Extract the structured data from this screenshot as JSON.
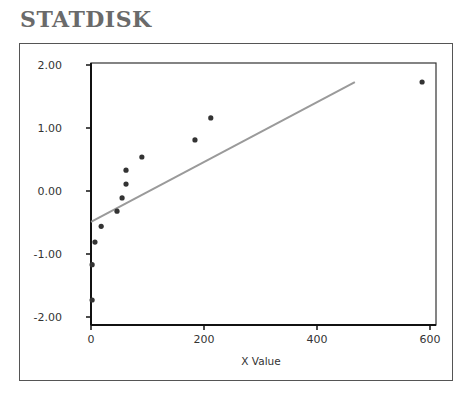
{
  "brand": "STATDISK",
  "chart_data": {
    "type": "scatter",
    "title": "",
    "xlabel": "X Value",
    "ylabel": "",
    "xlim": [
      0,
      610
    ],
    "ylim": [
      -2.1,
      2.1
    ],
    "x_ticks": [
      "0",
      "200",
      "400",
      "600"
    ],
    "y_ticks": [
      "2.00",
      "1.00",
      "0.00",
      "-1.00",
      "-2.00"
    ],
    "grid": false,
    "legend": null,
    "series": [
      {
        "name": "points",
        "type": "scatter",
        "x": [
          2,
          2,
          7,
          18,
          46,
          55,
          62,
          62,
          90,
          184,
          212,
          586
        ],
        "y": [
          -1.73,
          -1.17,
          -0.81,
          -0.56,
          -0.32,
          -0.11,
          0.11,
          0.33,
          0.54,
          0.81,
          1.16,
          1.73
        ]
      },
      {
        "name": "regression line",
        "type": "line",
        "x": [
          0,
          467
        ],
        "y": [
          -0.49,
          1.73
        ]
      }
    ]
  }
}
